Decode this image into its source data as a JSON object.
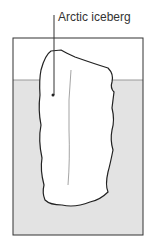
{
  "diagram": {
    "label": "Arctic iceberg",
    "colors": {
      "water": "#e3e3e3",
      "air": "#ffffff",
      "outline": "#222222",
      "waterline": "#9a9a9a"
    }
  }
}
